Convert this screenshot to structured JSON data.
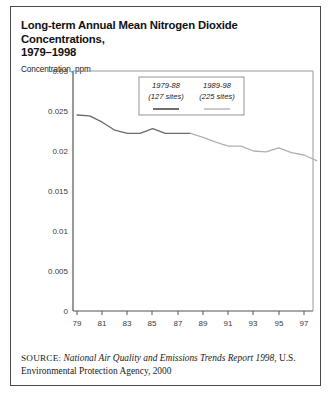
{
  "figure": {
    "title": "Long-term Annual Mean Nitrogen Dioxide Concentrations, 1979–1998",
    "title_line1": "Long-term Annual Mean Nitrogen Dioxide Concentrations,",
    "title_line2": "1979–1998",
    "axis_caption": "Concentration, ppm",
    "source_label": "SOURCE:",
    "source_italic": "National Air Quality and Emissions Trends Report 1998",
    "source_rest": ", U.S. Environmental Protection Agency, 2000"
  },
  "colors": {
    "frame": "#4a4a4a",
    "axis": "#555555",
    "series_1979_88": "#6b6b6b",
    "series_1989_98": "#b0b0b0",
    "text": "#1a1a1a",
    "tick_text": "#3a3a3a",
    "legend_border": "#8a8a8a",
    "background": "#ffffff"
  },
  "chart_data": {
    "type": "line",
    "title": "Long-term Annual Mean Nitrogen Dioxide Concentrations, 1979–1998",
    "xlabel": "",
    "ylabel": "Concentration, ppm",
    "ylim": [
      0,
      0.03
    ],
    "xlim": [
      79,
      98
    ],
    "grid": false,
    "legend_position": "top-center",
    "ytick_labels": [
      "0.03",
      "0.025",
      "0.02",
      "0.015",
      "0.01",
      "0.005",
      "0"
    ],
    "ytick_values": [
      0.03,
      0.025,
      0.02,
      0.015,
      0.01,
      0.005,
      0
    ],
    "xtick_labels": [
      "79",
      "81",
      "83",
      "85",
      "87",
      "89",
      "91",
      "93",
      "95",
      "97"
    ],
    "xtick_values": [
      79,
      81,
      83,
      85,
      87,
      89,
      91,
      93,
      95,
      97
    ],
    "series": [
      {
        "name": "1979-88",
        "sites_label": "(127 sites)",
        "color": "#6b6b6b",
        "x": [
          79,
          80,
          81,
          82,
          83,
          84,
          85,
          86,
          87,
          88
        ],
        "values": [
          0.0245,
          0.0244,
          0.0236,
          0.0226,
          0.0222,
          0.0222,
          0.0228,
          0.0222,
          0.0222,
          0.0222
        ]
      },
      {
        "name": "1989-98",
        "sites_label": "(225 sites)",
        "color": "#b0b0b0",
        "x": [
          88,
          89,
          90,
          91,
          92,
          93,
          94,
          95,
          96,
          97,
          98
        ],
        "values": [
          0.0222,
          0.0217,
          0.0211,
          0.0206,
          0.0206,
          0.02,
          0.0199,
          0.0204,
          0.0198,
          0.0195,
          0.0188
        ]
      }
    ]
  },
  "legend": {
    "entries": [
      {
        "label": "1979-88",
        "sites": "(127 sites)",
        "color": "#6b6b6b"
      },
      {
        "label": "1989-98",
        "sites": "(225 sites)",
        "color": "#b0b0b0"
      }
    ]
  }
}
